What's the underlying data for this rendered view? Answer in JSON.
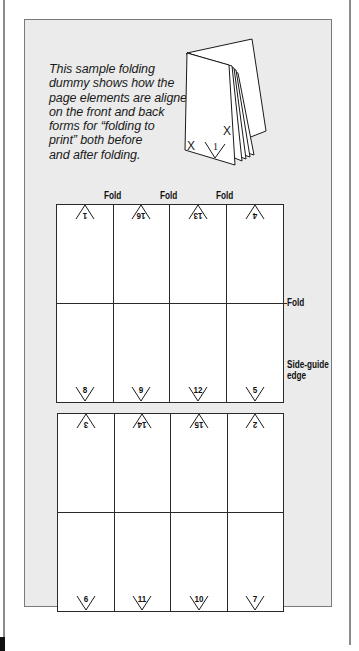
{
  "caption": {
    "lines": [
      "This sample folding",
      "dummy shows how the",
      "page elements are aligned",
      "on the front and back",
      "forms for “folding to",
      "print” both before",
      "and after folding."
    ]
  },
  "illustration": {
    "marks": [
      "X",
      "X",
      "1"
    ]
  },
  "labels": {
    "fold_top": [
      "Fold",
      "Fold",
      "Fold"
    ],
    "fold_side": "Fold",
    "side_guide_line1": "Side-guide",
    "side_guide_line2": "edge"
  },
  "front_form": {
    "top_row": [
      "1",
      "16",
      "13",
      "4"
    ],
    "bottom_row": [
      "8",
      "9",
      "12",
      "5"
    ]
  },
  "back_form": {
    "top_row": [
      "3",
      "14",
      "15",
      "2"
    ],
    "bottom_row": [
      "6",
      "11",
      "10",
      "7"
    ]
  },
  "colors": {
    "panel_bg": "#ebebeb",
    "line": "#2a2a2a",
    "page": "#ffffff"
  }
}
